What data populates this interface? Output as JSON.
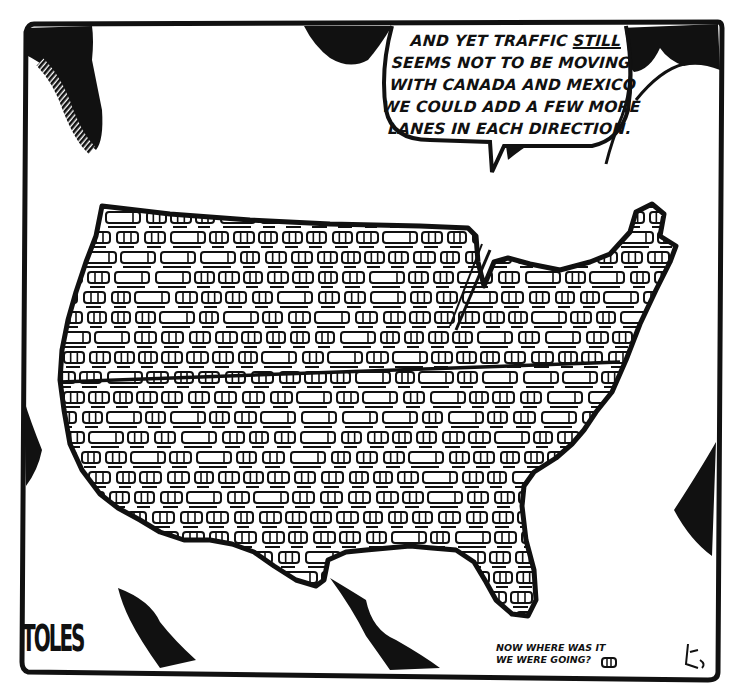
{
  "cartoon": {
    "speech_bubble": {
      "lines": [
        {
          "before": "AND YET TRAFFIC ",
          "emphasis": "STILL",
          "after": ""
        },
        {
          "before": "SEEMS NOT TO BE MOVING.",
          "emphasis": "",
          "after": ""
        },
        {
          "before": "WITH CANADA AND MEXICO",
          "emphasis": "",
          "after": ""
        },
        {
          "before": "WE COULD ADD A FEW MORE",
          "emphasis": "",
          "after": ""
        },
        {
          "before": "LANES IN EACH DIRECTION.",
          "emphasis": "",
          "after": ""
        }
      ]
    },
    "caption": {
      "lines": [
        "NOW WHERE WAS IT",
        "WE WERE GOING?"
      ]
    },
    "signature": "TOLES",
    "map_subject": "United States filled with traffic",
    "colors": {
      "ink": "#111111",
      "paper": "#ffffff"
    }
  }
}
